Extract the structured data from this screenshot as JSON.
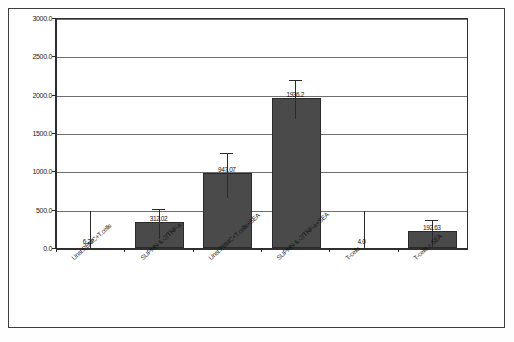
{
  "chart_data": {
    "type": "bar",
    "title": "",
    "xlabel": "",
    "ylabel": "",
    "ylim": [
      0,
      3000
    ],
    "grid": true,
    "legend": "none",
    "categories": [
      "Unst.PBMC+T.cells",
      "SUPMN IL-2/TNF-a",
      "Unst.PBMC+T.cells+SEA",
      "SUPMN IL-2/TNF-a+SEA",
      "T-cells",
      "T-cells + SEA"
    ],
    "values": [
      6.27,
      312.02,
      947.07,
      1936.2,
      4.0,
      192.63
    ],
    "value_labels": [
      "6.27",
      "312.02",
      "947.07",
      "1936.2",
      "4.0",
      "192.63"
    ],
    "errors": [
      0,
      195,
      290,
      255,
      0,
      175
    ],
    "yticks": [
      {
        "value": 3000,
        "label": "3000.0"
      },
      {
        "value": 2500,
        "label": "2500.0"
      },
      {
        "value": 2000,
        "label": "2000.0"
      },
      {
        "value": 1500,
        "label": "1500.0"
      },
      {
        "value": 1000,
        "label": "1000.0"
      },
      {
        "value": 500,
        "label": "500.0"
      },
      {
        "value": 0,
        "label": "0.0"
      }
    ],
    "bar_color": "#4a4a4a",
    "axis_color": "#2b2b2b",
    "grid_color": "#6d6d6d"
  }
}
